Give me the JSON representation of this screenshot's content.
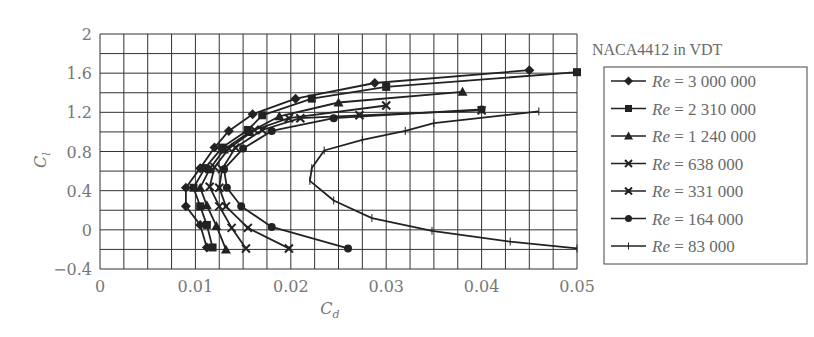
{
  "chart_data": {
    "type": "line",
    "title": "NACA4412 in VDT",
    "xlabel": "C_d",
    "ylabel": "C_l",
    "xlim": [
      0,
      0.05
    ],
    "ylim": [
      -0.4,
      2
    ],
    "xticks": [
      "0",
      "0.01",
      "0.02",
      "0.03",
      "0.04",
      "0.05"
    ],
    "yticks": [
      "2",
      "1.6",
      "1.2",
      "0.8",
      "0.4",
      "0",
      "−0.4"
    ],
    "grid": true,
    "grid_x_step": 0.0025,
    "grid_y_step": 0.2,
    "legend_position": "right",
    "series": [
      {
        "name": "Re = 3 000 000",
        "marker": "diamond",
        "points": [
          [
            0.0112,
            -0.18
          ],
          [
            0.0105,
            0.05
          ],
          [
            0.009,
            0.24
          ],
          [
            0.009,
            0.43
          ],
          [
            0.0105,
            0.63
          ],
          [
            0.012,
            0.84
          ],
          [
            0.0135,
            1.01
          ],
          [
            0.016,
            1.18
          ],
          [
            0.0205,
            1.34
          ],
          [
            0.0288,
            1.5
          ],
          [
            0.045,
            1.63
          ]
        ]
      },
      {
        "name": "Re = 2 310 000",
        "marker": "square",
        "points": [
          [
            0.0118,
            -0.18
          ],
          [
            0.0112,
            0.05
          ],
          [
            0.0105,
            0.24
          ],
          [
            0.0098,
            0.43
          ],
          [
            0.011,
            0.63
          ],
          [
            0.0128,
            0.84
          ],
          [
            0.0155,
            1.02
          ],
          [
            0.017,
            1.17
          ],
          [
            0.0222,
            1.34
          ],
          [
            0.03,
            1.46
          ],
          [
            0.05,
            1.61
          ]
        ]
      },
      {
        "name": "Re = 1 240 000",
        "marker": "triangle",
        "points": [
          [
            0.0132,
            -0.2
          ],
          [
            0.0122,
            0.04
          ],
          [
            0.0112,
            0.25
          ],
          [
            0.0105,
            0.43
          ],
          [
            0.0115,
            0.62
          ],
          [
            0.013,
            0.82
          ],
          [
            0.0157,
            1.0
          ],
          [
            0.0188,
            1.16
          ],
          [
            0.025,
            1.3
          ],
          [
            0.038,
            1.41
          ]
        ]
      },
      {
        "name": "Re = 638 000",
        "marker": "x",
        "points": [
          [
            0.0153,
            -0.19
          ],
          [
            0.0138,
            0.02
          ],
          [
            0.0125,
            0.24
          ],
          [
            0.0115,
            0.44
          ],
          [
            0.012,
            0.64
          ],
          [
            0.0135,
            0.83
          ],
          [
            0.0162,
            1.02
          ],
          [
            0.0198,
            1.14
          ],
          [
            0.03,
            1.27
          ]
        ]
      },
      {
        "name": "Re = 331 000",
        "marker": "star",
        "points": [
          [
            0.0198,
            -0.19
          ],
          [
            0.0155,
            0.02
          ],
          [
            0.0132,
            0.24
          ],
          [
            0.0125,
            0.43
          ],
          [
            0.0128,
            0.62
          ],
          [
            0.0142,
            0.84
          ],
          [
            0.017,
            1.02
          ],
          [
            0.021,
            1.14
          ],
          [
            0.0272,
            1.17
          ],
          [
            0.04,
            1.22
          ]
        ]
      },
      {
        "name": "Re = 164 000",
        "marker": "circle",
        "points": [
          [
            0.026,
            -0.19
          ],
          [
            0.018,
            0.03
          ],
          [
            0.0148,
            0.24
          ],
          [
            0.0133,
            0.43
          ],
          [
            0.013,
            0.62
          ],
          [
            0.015,
            0.83
          ],
          [
            0.018,
            1.01
          ],
          [
            0.0245,
            1.14
          ],
          [
            0.04,
            1.23
          ]
        ]
      },
      {
        "name": "Re = 83 000",
        "marker": "plus",
        "points": [
          [
            0.05,
            -0.19
          ],
          [
            0.043,
            -0.12
          ],
          [
            0.0348,
            -0.01
          ],
          [
            0.0285,
            0.12
          ],
          [
            0.0245,
            0.3
          ],
          [
            0.022,
            0.5
          ],
          [
            0.0222,
            0.63
          ],
          [
            0.0235,
            0.81
          ],
          [
            0.0275,
            0.92
          ],
          [
            0.032,
            1.01
          ],
          [
            0.035,
            1.09
          ],
          [
            0.046,
            1.21
          ]
        ]
      }
    ]
  }
}
